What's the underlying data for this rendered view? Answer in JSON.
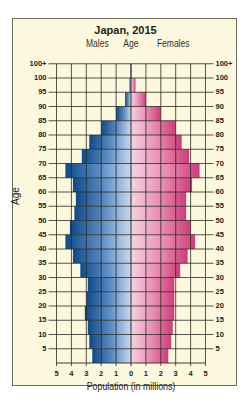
{
  "chart_data": {
    "type": "bar",
    "orientation": "horizontal-pyramid",
    "title": "Japan, 2015",
    "xlabel": "Population (in millions)",
    "ylabel": "Age",
    "center_label": "Age",
    "left_label": "Males",
    "right_label": "Females",
    "xlim": [
      -5,
      5
    ],
    "x_ticks": [
      "5",
      "4",
      "3",
      "2",
      "1",
      "0",
      "1",
      "2",
      "3",
      "4",
      "5"
    ],
    "y_ticks": [
      "5",
      "10",
      "15",
      "20",
      "25",
      "30",
      "35",
      "40",
      "45",
      "50",
      "55",
      "60",
      "65",
      "70",
      "75",
      "80",
      "85",
      "90",
      "95",
      "100",
      "100+"
    ],
    "grid": true,
    "categories": [
      "0-4",
      "5-9",
      "10-14",
      "15-19",
      "20-24",
      "25-29",
      "30-34",
      "35-39",
      "40-44",
      "45-49",
      "50-54",
      "55-59",
      "60-64",
      "65-69",
      "70-74",
      "75-79",
      "80-84",
      "85-89",
      "90-94",
      "95-99",
      "100+"
    ],
    "series": [
      {
        "name": "Males",
        "color": "#1f5a9c",
        "values": [
          2.6,
          2.8,
          2.9,
          3.1,
          3.0,
          2.9,
          3.4,
          3.9,
          4.4,
          4.1,
          3.8,
          3.7,
          3.9,
          4.4,
          3.3,
          2.8,
          2.0,
          1.0,
          0.4,
          0.1,
          0.03
        ]
      },
      {
        "name": "Females",
        "color": "#d84c86",
        "values": [
          2.5,
          2.7,
          2.8,
          2.9,
          2.9,
          2.9,
          3.3,
          3.8,
          4.3,
          4.0,
          3.7,
          3.7,
          4.1,
          4.6,
          3.9,
          3.4,
          3.0,
          2.0,
          1.0,
          0.3,
          0.05
        ]
      }
    ]
  }
}
